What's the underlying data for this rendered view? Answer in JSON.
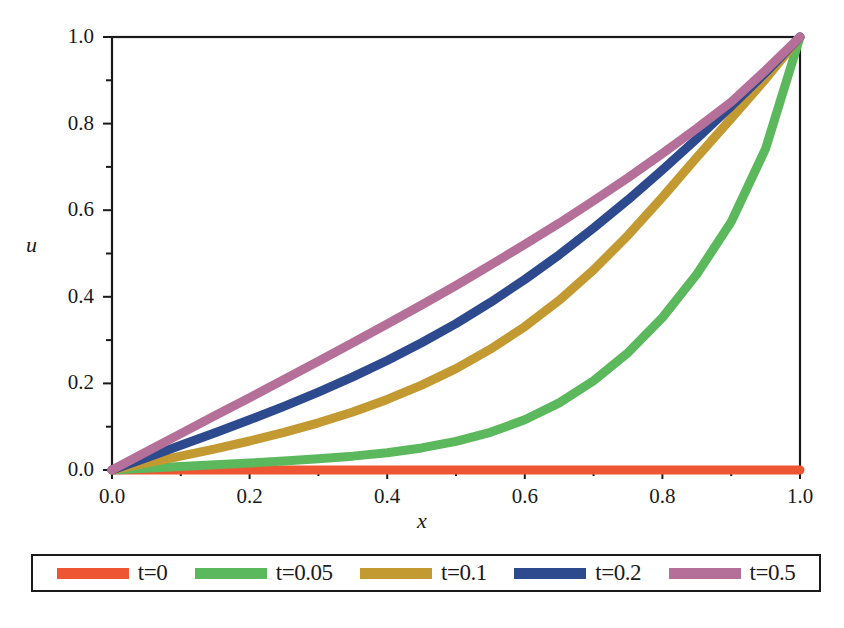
{
  "chart_data": {
    "type": "line",
    "title": "",
    "xlabel": "x",
    "ylabel": "u",
    "xlim": [
      0.0,
      1.0
    ],
    "ylim": [
      0.0,
      1.0
    ],
    "xticks": [
      "0.0",
      "0.2",
      "0.4",
      "0.6",
      "0.8",
      "1.0"
    ],
    "xtick_values": [
      0.0,
      0.2,
      0.4,
      0.6,
      0.8,
      1.0
    ],
    "yticks": [
      "0.0",
      "0.2",
      "0.4",
      "0.6",
      "0.8",
      "1.0"
    ],
    "ytick_values": [
      0.0,
      0.2,
      0.4,
      0.6,
      0.8,
      1.0
    ],
    "minor_tick_step": 0.1,
    "grid": false,
    "legend_position": "below",
    "x": [
      0.0,
      0.05,
      0.1,
      0.15,
      0.2,
      0.25,
      0.3,
      0.35,
      0.4,
      0.45,
      0.5,
      0.55,
      0.6,
      0.65,
      0.7,
      0.75,
      0.8,
      0.85,
      0.9,
      0.95,
      1.0
    ],
    "series": [
      {
        "name": "t=0",
        "color": "#EE5533",
        "values": [
          0.0,
          0.0,
          0.0,
          0.0,
          0.0,
          0.0,
          0.0,
          0.0,
          0.0,
          0.0,
          0.0,
          0.0,
          0.0,
          0.0,
          0.0,
          0.0,
          0.0,
          0.0,
          0.0,
          0.0,
          0.0
        ]
      },
      {
        "name": "t=0.05",
        "color": "#5CB85C",
        "values": [
          0.0,
          0.004,
          0.008,
          0.012,
          0.016,
          0.021,
          0.026,
          0.032,
          0.04,
          0.051,
          0.066,
          0.087,
          0.116,
          0.155,
          0.206,
          0.271,
          0.352,
          0.452,
          0.573,
          0.742,
          1.0
        ]
      },
      {
        "name": "t=0.1",
        "color": "#C39A31",
        "values": [
          0.0,
          0.016,
          0.032,
          0.049,
          0.067,
          0.087,
          0.109,
          0.134,
          0.163,
          0.196,
          0.234,
          0.279,
          0.331,
          0.392,
          0.462,
          0.542,
          0.63,
          0.722,
          0.812,
          0.903,
          1.0
        ]
      },
      {
        "name": "t=0.2",
        "color": "#2E4A8E",
        "values": [
          0.0,
          0.028,
          0.057,
          0.086,
          0.116,
          0.147,
          0.18,
          0.215,
          0.253,
          0.294,
          0.338,
          0.387,
          0.44,
          0.497,
          0.559,
          0.624,
          0.693,
          0.765,
          0.84,
          0.918,
          1.0
        ]
      },
      {
        "name": "t=0.5",
        "color": "#B5709A",
        "values": [
          0.0,
          0.042,
          0.084,
          0.126,
          0.167,
          0.209,
          0.251,
          0.294,
          0.337,
          0.381,
          0.426,
          0.473,
          0.521,
          0.57,
          0.622,
          0.675,
          0.731,
          0.789,
          0.85,
          0.923,
          1.0
        ]
      }
    ]
  },
  "axes": {
    "xlabel": "x",
    "ylabel": "u"
  },
  "legend": {
    "entries": [
      {
        "label": "t=0",
        "color": "#EE5533"
      },
      {
        "label": "t=0.05",
        "color": "#5CB85C"
      },
      {
        "label": "t=0.1",
        "color": "#C39A31"
      },
      {
        "label": "t=0.2",
        "color": "#2E4A8E"
      },
      {
        "label": "t=0.5",
        "color": "#B5709A"
      }
    ]
  }
}
